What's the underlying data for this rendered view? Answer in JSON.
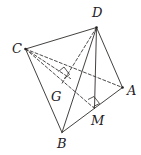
{
  "figure": {
    "kind": "tetrahedron-diagram",
    "width": 141,
    "height": 155,
    "background_color": "#ffffff",
    "stroke_color": "#3a3735",
    "label_color": "#23201e",
    "stroke_width": 0.9,
    "dash_pattern": "3 2.2"
  },
  "vertices": {
    "C": {
      "label": "C",
      "x": 25.5,
      "y": 49.0,
      "label_x": 12,
      "label_y": 42,
      "dot": true
    },
    "D": {
      "label": "D",
      "x": 96.5,
      "y": 27.5,
      "label_x": 92,
      "label_y": 6,
      "dot": true
    },
    "A": {
      "label": "A",
      "x": 122.5,
      "y": 87.5,
      "label_x": 127,
      "label_y": 84,
      "dot": true
    },
    "B": {
      "label": "B",
      "x": 62.0,
      "y": 132.5,
      "label_x": 57,
      "label_y": 137,
      "dot": false
    },
    "M": {
      "label": "M",
      "x": 94.5,
      "y": 108.5,
      "label_x": 91,
      "label_y": 114,
      "dot": false
    },
    "G": {
      "label": "G",
      "x": 62.0,
      "y": 86.0,
      "label_x": 51,
      "label_y": 90,
      "dot": false
    }
  },
  "edges": [
    {
      "name": "edge-CD",
      "from": "C",
      "to": "D",
      "style": "solid"
    },
    {
      "name": "edge-CB",
      "from": "C",
      "to": "B",
      "style": "solid"
    },
    {
      "name": "edge-DB",
      "from": "D",
      "to": "B",
      "style": "solid"
    },
    {
      "name": "edge-DA",
      "from": "D",
      "to": "A",
      "style": "solid"
    },
    {
      "name": "edge-AB",
      "from": "A",
      "to": "B",
      "style": "solid"
    },
    {
      "name": "edge-DM",
      "from": "D",
      "to": "M",
      "style": "solid"
    },
    {
      "name": "edge-CA",
      "from": "C",
      "to": "A",
      "style": "dashed"
    },
    {
      "name": "edge-CM",
      "from": "C",
      "to": "M",
      "style": "dashed"
    },
    {
      "name": "edge-CG-segment",
      "from": "C",
      "to": "G",
      "style": "dashed"
    },
    {
      "name": "edge-DG",
      "from": "D",
      "to": "G",
      "style": "dashed"
    }
  ],
  "right_angle_marks": [
    {
      "name": "right-angle-at-G",
      "points": "58.5,71.5 64.0,67.0 69.5,74.5 64.0,78.5"
    },
    {
      "name": "right-angle-at-M",
      "points": "88.0,99.5 94.0,96.5 99.5,103.5 93.5,106.5"
    }
  ],
  "labels_order": [
    "D",
    "C",
    "A",
    "G",
    "M",
    "B"
  ]
}
